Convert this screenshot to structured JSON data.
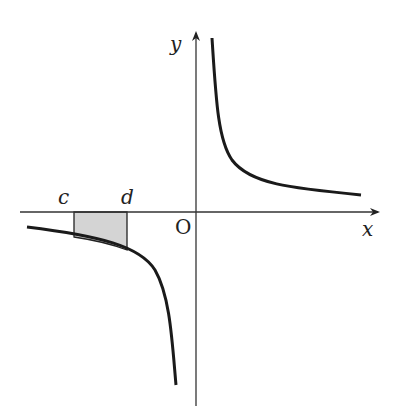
{
  "diagram": {
    "type": "graph-of-hyperbola",
    "labels": {
      "x_axis": "x",
      "y_axis": "y",
      "origin": "O",
      "left_bound": "c",
      "right_bound": "d"
    },
    "colors": {
      "curve": "#1a1a1a",
      "axis": "#333333",
      "shade": "#d4d4d4"
    }
  }
}
